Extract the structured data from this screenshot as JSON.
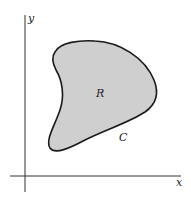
{
  "figure": {
    "axes": {
      "x_label": "x",
      "y_label": "y"
    },
    "region": {
      "label": "R",
      "fill_color": "#cfcfcf",
      "stroke_color": "#1a1a1a"
    },
    "curve": {
      "label": "C"
    }
  }
}
